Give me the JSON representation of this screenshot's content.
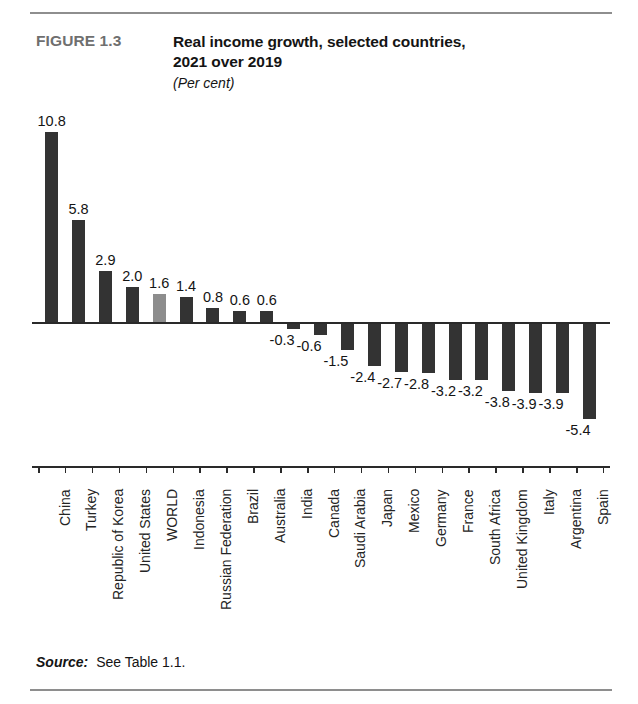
{
  "figure": {
    "label": "FIGURE 1.3",
    "title_line1": "Real income growth, selected countries,",
    "title_line2": "2021 over 2019",
    "subtitle": "(Per cent)"
  },
  "source": {
    "key": "Source:",
    "value": "See Table 1.1."
  },
  "colors": {
    "bar": "#333333",
    "bar_highlight": "#8d8d8d",
    "axis": "#2a2a2a",
    "rule": "#8e8e8e",
    "figure_label": "#6f6f6f"
  },
  "chart_data": {
    "type": "bar",
    "title": "Real income growth, selected countries, 2021 over 2019",
    "subtitle": "(Per cent)",
    "xlabel": "",
    "ylabel": "Per cent",
    "ylim": [
      -6.0,
      11.5
    ],
    "grid": false,
    "legend": "none",
    "highlight_category": "WORLD",
    "categories": [
      "China",
      "Turkey",
      "Republic of Korea",
      "United States",
      "WORLD",
      "Indonesia",
      "Russian Federation",
      "Brazil",
      "Australia",
      "India",
      "Canada",
      "Saudi Arabia",
      "Japan",
      "Mexico",
      "Germany",
      "France",
      "South Africa",
      "United Kingdom",
      "Italy",
      "Argentina",
      "Spain"
    ],
    "values": [
      10.8,
      5.8,
      2.9,
      2.0,
      1.6,
      1.4,
      0.8,
      0.6,
      0.6,
      -0.3,
      -0.6,
      -1.5,
      -2.4,
      -2.7,
      -2.8,
      -3.2,
      -3.2,
      -3.8,
      -3.9,
      -3.9,
      -5.4
    ],
    "value_labels": [
      "10.8",
      "5.8",
      "2.9",
      "2.0",
      "1.6",
      "1.4",
      "0.8",
      "0.6",
      "0.6",
      "-0.3",
      "-0.6",
      "-1.5",
      "-2.4",
      "-2.7",
      "-2.8",
      "-3.2",
      "-3.2",
      "-3.8",
      "-3.9",
      "-3.9",
      "-5.4"
    ]
  }
}
